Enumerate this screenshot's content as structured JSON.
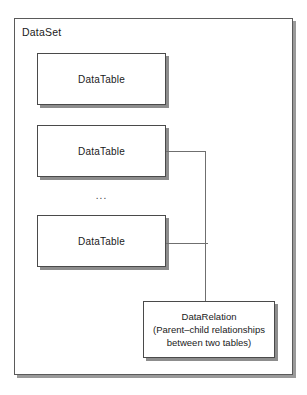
{
  "diagram": {
    "container": {
      "label": "DataSet"
    },
    "tables": [
      {
        "label": "DataTable"
      },
      {
        "label": "DataTable"
      },
      {
        "label": "DataTable"
      }
    ],
    "ellipsis": "...",
    "relation": {
      "title": "DataRelation",
      "description_line1": "(Parent–child relationships",
      "description_line2": "between two tables)"
    },
    "colors": {
      "background": "#ffffff",
      "box_border": "#4a4a4a",
      "container_border": "#5a5a5a",
      "shadow": "#8d8d8d",
      "connector_line": "#6f6f6f",
      "text": "#1a1a1a"
    }
  }
}
